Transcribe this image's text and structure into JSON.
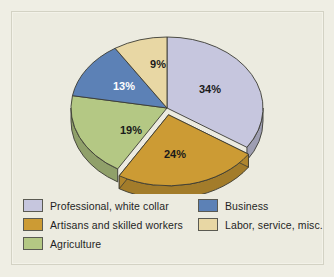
{
  "chart_data": {
    "type": "pie",
    "title": "",
    "subtitle": "",
    "xlabel": "",
    "ylabel": "",
    "grid": false,
    "legend_position": "bottom",
    "style": "3d-pie",
    "start_angle_deg": 0,
    "direction": "clockwise",
    "value_unit": "percent",
    "categories": [
      "Professional, white collar",
      "Artisans and skilled workers",
      "Agriculture",
      "Business",
      "Labor, service, misc."
    ],
    "values": [
      34,
      24,
      19,
      13,
      9
    ],
    "data_labels": [
      "34%",
      "24%",
      "19%",
      "13%",
      "9%"
    ],
    "colors": [
      "#c6c6de",
      "#cc9b34",
      "#b4c884",
      "#5c81b6",
      "#e8d7a4"
    ],
    "exploded": [
      false,
      true,
      false,
      false,
      false
    ],
    "slices": [
      {
        "label": "Professional, white collar",
        "value": 34,
        "data_label": "34%",
        "color": "#c6c6de",
        "label_color": "#1a1a1a"
      },
      {
        "label": "Artisans and skilled workers",
        "value": 24,
        "data_label": "24%",
        "color": "#cc9b34",
        "label_color": "#1a1a1a"
      },
      {
        "label": "Agriculture",
        "value": 19,
        "data_label": "19%",
        "color": "#b4c884",
        "label_color": "#1a1a1a"
      },
      {
        "label": "Business",
        "value": 13,
        "data_label": "13%",
        "color": "#5c81b6",
        "label_color": "#ffffff"
      },
      {
        "label": "Labor, service, misc.",
        "value": 9,
        "data_label": "9%",
        "color": "#e8d7a4",
        "label_color": "#1a1a1a"
      }
    ]
  },
  "figure": {
    "background_color": "#ecebe0",
    "page_background_color": "#efeee4",
    "border_color": "#d3d2c4",
    "outline_color": "#3b3b33"
  },
  "labels": {
    "professional": "34%",
    "artisans": "24%",
    "agriculture": "19%",
    "business": "13%",
    "labor": "9%"
  },
  "legend": {
    "left_column": [
      {
        "label": "Professional, white collar",
        "color": "#c6c6de"
      },
      {
        "label": "Artisans and skilled workers",
        "color": "#cc9b34"
      },
      {
        "label": "Agriculture",
        "color": "#b4c884"
      }
    ],
    "right_column": [
      {
        "label": "Business",
        "color": "#5c81b6"
      },
      {
        "label": "Labor, service, misc.",
        "color": "#e8d7a4"
      }
    ]
  }
}
